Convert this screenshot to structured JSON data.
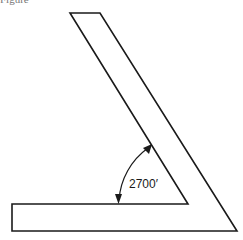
{
  "figure": {
    "caption": "Figure",
    "angle_label": "2700′",
    "shape": {
      "description": "L-shaped bent bar with an inclined arm",
      "outline_points": [
        [
          70,
          13
        ],
        [
          100,
          13
        ],
        [
          237,
          231
        ],
        [
          12,
          231
        ],
        [
          12,
          204
        ],
        [
          188,
          204
        ],
        [
          70,
          13
        ]
      ]
    },
    "angle_arc": {
      "center": [
        188,
        204
      ],
      "radius": 70,
      "start_point": [
        118,
        204
      ],
      "end_point": [
        151,
        145
      ],
      "arrows": "both-ends"
    },
    "colors": {
      "line": "#1a1a1a",
      "background": "#ffffff"
    }
  }
}
